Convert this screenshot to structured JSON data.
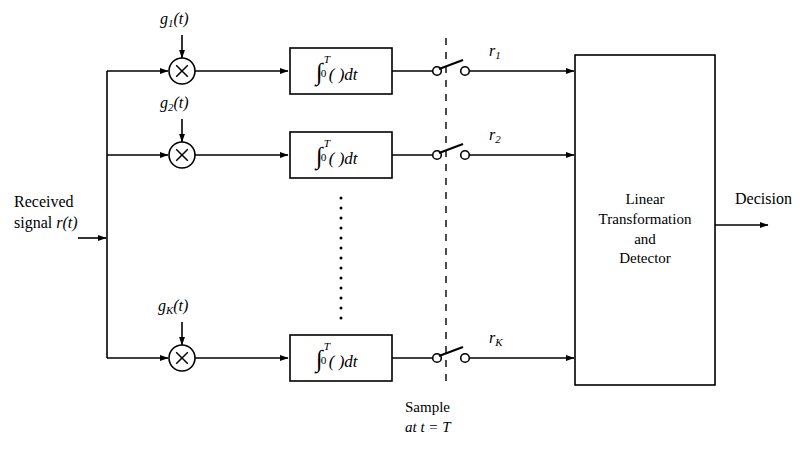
{
  "figure": {
    "stroke_color": "#000000",
    "background_color": "#ffffff"
  },
  "input": {
    "line1": "Received",
    "line2_prefix": "signal ",
    "line2_signal": "r(t)",
    "arrow_name": "received-signal-arrow"
  },
  "branches": [
    {
      "id": "branch-1",
      "gain_label_base": "g",
      "gain_label_sub": "1",
      "gain_label_tail": "(t)",
      "multiplier_glyph": "×",
      "integrator": {
        "sign": "∫",
        "upper": "T",
        "lower": "0",
        "body": "( )dt"
      },
      "output_label_base": "r",
      "output_label_sub": "1"
    },
    {
      "id": "branch-2",
      "gain_label_base": "g",
      "gain_label_sub": "2",
      "gain_label_tail": "(t)",
      "multiplier_glyph": "×",
      "integrator": {
        "sign": "∫",
        "upper": "T",
        "lower": "0",
        "body": "( )dt"
      },
      "output_label_base": "r",
      "output_label_sub": "2"
    },
    {
      "id": "branch-K",
      "gain_label_base": "g",
      "gain_label_sub": "K",
      "gain_label_tail": "(t)",
      "multiplier_glyph": "×",
      "integrator": {
        "sign": "∫",
        "upper": "T",
        "lower": "0",
        "body": "( )dt"
      },
      "output_label_base": "r",
      "output_label_sub": "K"
    }
  ],
  "sampler": {
    "caption_line1": "Sample",
    "caption_line2": "at t = T"
  },
  "detector": {
    "line1": "Linear",
    "line2": "Transformation",
    "line3": "and",
    "line4": "Detector"
  },
  "output": {
    "label": "Decision"
  },
  "ellipsis": {
    "vertical_dots": "⋮"
  }
}
